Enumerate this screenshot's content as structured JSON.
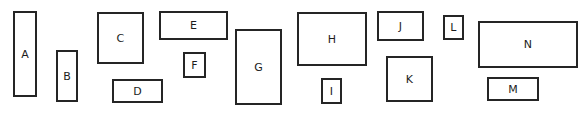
{
  "figure": {
    "title": "",
    "background_color": "#ffffff",
    "stroke_color": "#252525",
    "label_color": "#1c1c1c",
    "width": 583,
    "height": 113,
    "shape_count": 14
  },
  "shapes": [
    {
      "label": "A",
      "x": 13,
      "y": 11,
      "w": 24,
      "h": 86
    },
    {
      "label": "B",
      "x": 56,
      "y": 50,
      "w": 22,
      "h": 52
    },
    {
      "label": "C",
      "x": 97,
      "y": 12,
      "w": 47,
      "h": 52
    },
    {
      "label": "D",
      "x": 112,
      "y": 79,
      "w": 51,
      "h": 24
    },
    {
      "label": "E",
      "x": 159,
      "y": 11,
      "w": 69,
      "h": 29
    },
    {
      "label": "F",
      "x": 183,
      "y": 52,
      "w": 23,
      "h": 26
    },
    {
      "label": "G",
      "x": 235,
      "y": 29,
      "w": 47,
      "h": 76
    },
    {
      "label": "H",
      "x": 297,
      "y": 12,
      "w": 70,
      "h": 54
    },
    {
      "label": "I",
      "x": 321,
      "y": 78,
      "w": 21,
      "h": 26
    },
    {
      "label": "J",
      "x": 377,
      "y": 11,
      "w": 47,
      "h": 30
    },
    {
      "label": "K",
      "x": 386,
      "y": 56,
      "w": 47,
      "h": 46
    },
    {
      "label": "L",
      "x": 443,
      "y": 15,
      "w": 21,
      "h": 25
    },
    {
      "label": "M",
      "x": 487,
      "y": 77,
      "w": 52,
      "h": 24
    },
    {
      "label": "N",
      "x": 478,
      "y": 21,
      "w": 100,
      "h": 47
    }
  ]
}
